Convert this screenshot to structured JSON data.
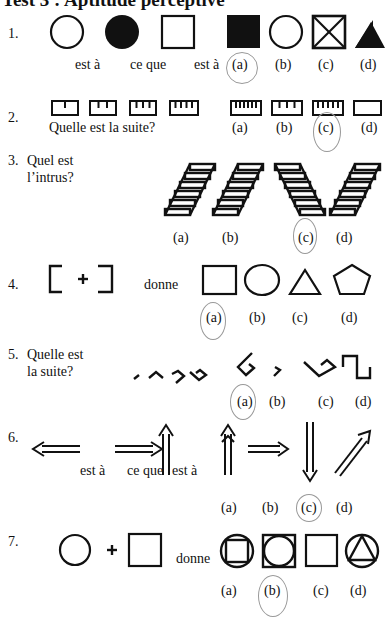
{
  "page": {
    "title": "Test 3 : Aptitude perceptive"
  },
  "q1": {
    "number": "1.",
    "text1": "est à",
    "text2": "ce que",
    "text3": "est à",
    "options": [
      "(a)",
      "(b)",
      "(c)",
      "(d)"
    ],
    "circled": "(a)"
  },
  "q2": {
    "number": "2.",
    "prompt": "Quelle est la suite?",
    "options": [
      "(a)",
      "(b)",
      "(c)",
      "(d)"
    ],
    "circled": "(c)"
  },
  "q3": {
    "number": "3.",
    "prompt_line1": "Quel est",
    "prompt_line2": "l’intrus?",
    "options": [
      "(a)",
      "(b)",
      "(c)",
      "(d)"
    ],
    "circled": "(c)"
  },
  "q4": {
    "number": "4.",
    "text": "donne",
    "options": [
      "(a)",
      "(b)",
      "(c)",
      "(d)"
    ],
    "circled": "(a)"
  },
  "q5": {
    "number": "5.",
    "prompt_line1": "Quelle est",
    "prompt_line2": "la suite?",
    "options": [
      "(a)",
      "(b)",
      "(c)",
      "(d)"
    ],
    "circled": "(a)"
  },
  "q6": {
    "number": "6.",
    "text1": "est à",
    "text2": "ce que",
    "text3": "est à",
    "options": [
      "(a)",
      "(b)",
      "(c)",
      "(d)"
    ],
    "circled": "(c)"
  },
  "q7": {
    "number": "7.",
    "text": "donne",
    "options": [
      "(a)",
      "(b)",
      "(c)",
      "(d)"
    ],
    "circled": "(b)"
  }
}
